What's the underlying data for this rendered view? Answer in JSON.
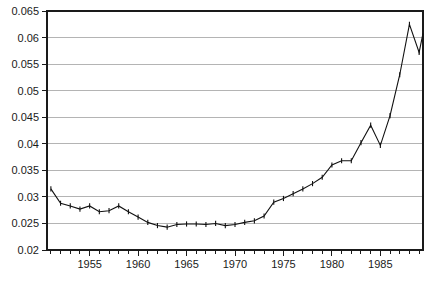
{
  "chart_data": {
    "type": "line",
    "title": "",
    "subtitle": "",
    "xlabel": "",
    "ylabel": "",
    "xlim": [
      1950.6,
      1989.4
    ],
    "ylim": [
      0.02,
      0.065
    ],
    "grid": "horizontal",
    "legend": "none",
    "y_ticks": [
      0.02,
      0.025,
      0.03,
      0.035,
      0.04,
      0.045,
      0.05,
      0.055,
      0.06,
      0.065
    ],
    "y_tick_labels": [
      "0.02",
      "0.025",
      "0.03",
      "0.035",
      "0.04",
      "0.045",
      "0.05",
      "0.055",
      "0.06",
      "0.065"
    ],
    "x_ticks_major": [
      1955,
      1960,
      1965,
      1970,
      1975,
      1980,
      1985
    ],
    "x_tick_labels": [
      "1955",
      "1960",
      "1965",
      "1970",
      "1975",
      "1980",
      "1985"
    ],
    "x_minor_tick_interval": 1,
    "x_minor_tick_start": 1951,
    "x_minor_tick_end": 1989,
    "marker_style": "vertical-tick",
    "line_color": "#111111",
    "grid_color": "#b4b4b4",
    "axis_color": "#1a1a1a",
    "background_color": "#ffffff",
    "x": [
      1951,
      1952,
      1953,
      1954,
      1955,
      1956,
      1957,
      1958,
      1959,
      1960,
      1961,
      1962,
      1963,
      1964,
      1965,
      1966,
      1967,
      1968,
      1969,
      1970,
      1971,
      1972,
      1973,
      1974,
      1975,
      1976,
      1977,
      1978,
      1979,
      1980,
      1981,
      1982,
      1983,
      1984,
      1985,
      1986,
      1987,
      1988,
      1989
    ],
    "values": [
      0.0315,
      0.0288,
      0.0283,
      0.0277,
      0.0283,
      0.0272,
      0.0274,
      0.0283,
      0.0272,
      0.0262,
      0.0252,
      0.0246,
      0.0243,
      0.0248,
      0.0249,
      0.0249,
      0.0248,
      0.025,
      0.0246,
      0.0248,
      0.0252,
      0.0255,
      0.0264,
      0.029,
      0.0297,
      0.0306,
      0.0315,
      0.0325,
      0.0337,
      0.036,
      0.0368,
      0.0368,
      0.0402,
      0.0435,
      0.0397,
      0.0453,
      0.053,
      0.0625,
      0.0572
    ],
    "last_value": 0.0608,
    "series_name": "value"
  },
  "axis": {
    "y_label_prefix": "",
    "x_label_prefix": ""
  }
}
